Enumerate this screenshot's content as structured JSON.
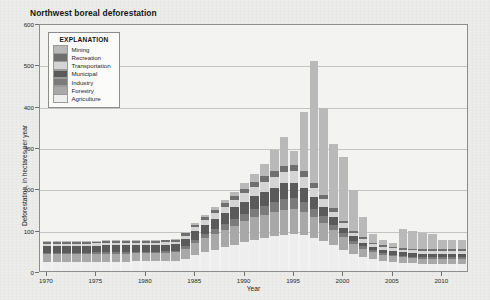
{
  "figure": {
    "title": "Northwest boreal deforestation"
  },
  "legend": {
    "title": "EXPLANATION",
    "items": [
      {
        "label": "Mining",
        "color": "#b9b9b9"
      },
      {
        "label": "Recreation",
        "color": "#6f6f6f"
      },
      {
        "label": "Transportation",
        "color": "#d4d4d4"
      },
      {
        "label": "Municipal",
        "color": "#5a5a5a"
      },
      {
        "label": "Industry",
        "color": "#7b7b7b"
      },
      {
        "label": "Forestry",
        "color": "#a8a8a8"
      },
      {
        "label": "Agriculture",
        "color": "#eeeeee"
      }
    ]
  },
  "chart_data": {
    "type": "bar",
    "stacked": true,
    "title": "Northwest boreal deforestation",
    "xlabel": "Year",
    "ylabel": "Deforestation, in hectares per year",
    "xlim": [
      1969.3,
      2012.7
    ],
    "ylim": [
      0,
      600
    ],
    "ytick_values": [
      0,
      100,
      200,
      300,
      400,
      500,
      600
    ],
    "ytick_labels": [
      "0",
      "100",
      "200",
      "300",
      "400",
      "500",
      "600"
    ],
    "xtick_values": [
      1970,
      1975,
      1980,
      1985,
      1990,
      1995,
      2000,
      2005,
      2010
    ],
    "xtick_labels": [
      "1970",
      "1975",
      "1980",
      "1985",
      "1990",
      "1995",
      "2000",
      "2005",
      "2010"
    ],
    "grid": "horizontal",
    "legend_position": "upper-left-inset",
    "categories": [
      1970,
      1971,
      1972,
      1973,
      1974,
      1975,
      1976,
      1977,
      1978,
      1979,
      1980,
      1981,
      1982,
      1983,
      1984,
      1985,
      1986,
      1987,
      1988,
      1989,
      1990,
      1991,
      1992,
      1993,
      1994,
      1995,
      1996,
      1997,
      1998,
      1999,
      2000,
      2001,
      2002,
      2003,
      2004,
      2005,
      2006,
      2007,
      2008,
      2009,
      2010,
      2011,
      2012
    ],
    "series": [
      {
        "name": "Agriculture",
        "color": "#eeeeee",
        "values": [
          22,
          22,
          22,
          22,
          22,
          23,
          23,
          23,
          23,
          24,
          24,
          24,
          24,
          25,
          30,
          38,
          45,
          52,
          58,
          64,
          70,
          76,
          80,
          84,
          88,
          90,
          86,
          80,
          72,
          62,
          52,
          42,
          34,
          28,
          24,
          22,
          20,
          19,
          18,
          18,
          18,
          18,
          18
        ]
      },
      {
        "name": "Forestry",
        "color": "#a8a8a8",
        "values": [
          18,
          18,
          18,
          18,
          18,
          18,
          19,
          19,
          19,
          19,
          19,
          19,
          20,
          20,
          24,
          30,
          34,
          38,
          42,
          46,
          50,
          54,
          56,
          58,
          60,
          60,
          56,
          50,
          44,
          38,
          30,
          24,
          20,
          17,
          15,
          14,
          13,
          12,
          12,
          12,
          12,
          12,
          12
        ]
      },
      {
        "name": "Industry",
        "color": "#7b7b7b",
        "values": [
          4,
          4,
          4,
          4,
          4,
          4,
          4,
          4,
          4,
          4,
          4,
          4,
          4,
          4,
          6,
          8,
          10,
          12,
          14,
          16,
          18,
          20,
          22,
          24,
          26,
          26,
          24,
          20,
          16,
          12,
          9,
          7,
          6,
          5,
          5,
          4,
          4,
          4,
          4,
          4,
          4,
          4,
          4
        ]
      },
      {
        "name": "Municipal",
        "color": "#5a5a5a",
        "values": [
          16,
          16,
          16,
          16,
          16,
          16,
          16,
          16,
          16,
          16,
          16,
          16,
          16,
          16,
          18,
          20,
          22,
          24,
          26,
          28,
          30,
          32,
          34,
          36,
          38,
          38,
          35,
          30,
          24,
          18,
          14,
          11,
          9,
          8,
          8,
          8,
          8,
          8,
          8,
          8,
          8,
          8,
          8
        ]
      },
      {
        "name": "Transportation",
        "color": "#d4d4d4",
        "values": [
          6,
          6,
          6,
          6,
          6,
          6,
          6,
          6,
          6,
          6,
          6,
          6,
          6,
          6,
          8,
          10,
          12,
          14,
          16,
          18,
          20,
          22,
          24,
          26,
          28,
          28,
          26,
          22,
          18,
          14,
          11,
          9,
          8,
          7,
          7,
          7,
          7,
          7,
          7,
          7,
          7,
          7,
          7
        ]
      },
      {
        "name": "Recreation",
        "color": "#6f6f6f",
        "values": [
          4,
          4,
          4,
          4,
          4,
          4,
          4,
          4,
          4,
          4,
          4,
          4,
          4,
          4,
          5,
          6,
          7,
          8,
          9,
          10,
          11,
          12,
          13,
          14,
          15,
          15,
          14,
          12,
          10,
          8,
          6,
          5,
          5,
          4,
          4,
          4,
          4,
          4,
          4,
          4,
          4,
          4,
          4
        ]
      },
      {
        "name": "Mining",
        "color": "#b9b9b9",
        "values": [
          2,
          2,
          2,
          2,
          2,
          2,
          2,
          2,
          2,
          2,
          2,
          2,
          2,
          2,
          3,
          4,
          5,
          6,
          8,
          10,
          14,
          20,
          30,
          50,
          70,
          33,
          145,
          295,
          210,
          155,
          155,
          98,
          48,
          20,
          12,
          10,
          45,
          42,
          38,
          36,
          22,
          22,
          22
        ]
      }
    ],
    "totals": [
      72,
      72,
      72,
      72,
      72,
      73,
      74,
      74,
      74,
      75,
      75,
      75,
      76,
      77,
      94,
      116,
      135,
      154,
      173,
      192,
      213,
      236,
      259,
      292,
      325,
      290,
      386,
      509,
      394,
      307,
      277,
      196,
      130,
      89,
      75,
      69,
      101,
      96,
      91,
      89,
      75,
      75,
      75
    ]
  }
}
